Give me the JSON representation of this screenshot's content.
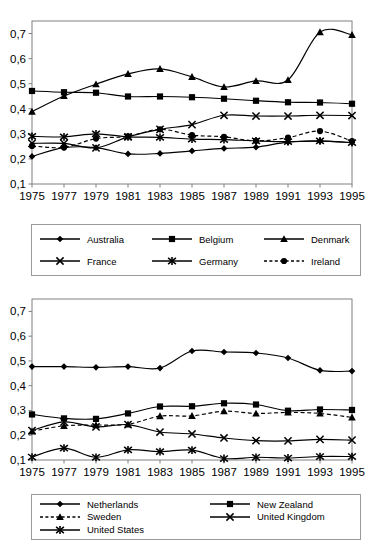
{
  "chart_data": [
    {
      "type": "line",
      "title": "",
      "xlabel": "",
      "ylabel": "",
      "x": [
        1975,
        1977,
        1979,
        1981,
        1983,
        1985,
        1987,
        1989,
        1991,
        1993,
        1995
      ],
      "xtick_labels": [
        "1975",
        "1977",
        "1979",
        "1981",
        "1983",
        "1985",
        "1987",
        "1989",
        "1991",
        "1993",
        "1995"
      ],
      "ytick_labels": [
        "0,1",
        "0,2",
        "0,3",
        "0,4",
        "0,5",
        "0,6",
        "0,7"
      ],
      "yticks": [
        0.1,
        0.2,
        0.3,
        0.4,
        0.5,
        0.6,
        0.7
      ],
      "ylim": [
        0.1,
        0.75
      ],
      "grid": false,
      "legend_position": "below",
      "series": [
        {
          "name": "Australia",
          "marker": "diamond",
          "dash": "solid",
          "values": [
            0.21,
            0.245,
            0.245,
            0.22,
            0.222,
            0.232,
            0.242,
            0.247,
            0.267,
            0.271,
            0.265
          ]
        },
        {
          "name": "Belgium",
          "marker": "square",
          "dash": "solid",
          "values": [
            0.471,
            0.466,
            0.464,
            0.449,
            0.449,
            0.446,
            0.44,
            0.432,
            0.426,
            0.425,
            0.42
          ]
        },
        {
          "name": "Denmark",
          "marker": "triangle",
          "dash": "solid",
          "values": [
            0.389,
            0.451,
            0.498,
            0.539,
            0.559,
            0.527,
            0.487,
            0.511,
            0.515,
            0.706,
            0.695
          ]
        },
        {
          "name": "France",
          "marker": "x",
          "dash": "solid",
          "values": [
            0.262,
            0.262,
            0.244,
            0.288,
            0.318,
            0.337,
            0.374,
            0.371,
            0.371,
            0.374,
            0.373
          ]
        },
        {
          "name": "Germany",
          "marker": "star",
          "dash": "solid",
          "values": [
            0.29,
            0.288,
            0.3,
            0.288,
            0.286,
            0.279,
            0.277,
            0.272,
            0.269,
            0.272,
            0.265
          ]
        },
        {
          "name": "Ireland",
          "marker": "circle",
          "dash": "dashed",
          "values": [
            0.252,
            0.246,
            0.281,
            0.29,
            0.318,
            0.295,
            0.288,
            0.272,
            0.285,
            0.311,
            0.271
          ]
        }
      ]
    },
    {
      "type": "line",
      "title": "",
      "xlabel": "",
      "ylabel": "",
      "x": [
        1975,
        1977,
        1979,
        1981,
        1983,
        1985,
        1987,
        1989,
        1991,
        1993,
        1995
      ],
      "xtick_labels": [
        "1975",
        "1977",
        "1979",
        "1981",
        "1983",
        "1985",
        "1987",
        "1989",
        "1991",
        "1993",
        "1995"
      ],
      "ytick_labels": [
        "0,1",
        "0,2",
        "0,3",
        "0,4",
        "0,5",
        "0,6",
        "0,7"
      ],
      "yticks": [
        0.1,
        0.2,
        0.3,
        0.4,
        0.5,
        0.6,
        0.7
      ],
      "ylim": [
        0.1,
        0.75
      ],
      "grid": false,
      "legend_position": "below",
      "series": [
        {
          "name": "Netherlands",
          "marker": "diamond",
          "dash": "solid",
          "values": [
            0.477,
            0.477,
            0.474,
            0.477,
            0.471,
            0.54,
            0.536,
            0.532,
            0.512,
            0.462,
            0.459
          ]
        },
        {
          "name": "New Zealand",
          "marker": "square",
          "dash": "solid",
          "values": [
            0.284,
            0.268,
            0.266,
            0.288,
            0.316,
            0.317,
            0.329,
            0.324,
            0.299,
            0.304,
            0.302
          ]
        },
        {
          "name": "Sweden",
          "marker": "triangle",
          "dash": "dashed",
          "values": [
            0.216,
            0.238,
            0.241,
            0.244,
            0.277,
            0.278,
            0.297,
            0.288,
            0.292,
            0.288,
            0.272
          ]
        },
        {
          "name": "United Kingdom",
          "marker": "x",
          "dash": "solid",
          "values": [
            0.219,
            0.254,
            0.234,
            0.243,
            0.213,
            0.205,
            0.189,
            0.178,
            0.177,
            0.183,
            0.18
          ]
        },
        {
          "name": "United States",
          "marker": "star",
          "dash": "solid",
          "values": [
            0.112,
            0.148,
            0.111,
            0.141,
            0.134,
            0.14,
            0.106,
            0.111,
            0.108,
            0.114,
            0.114
          ]
        }
      ]
    }
  ],
  "chart1": {
    "legend": [
      {
        "label": "Australia",
        "marker": "diamond",
        "dash": "solid"
      },
      {
        "label": "Belgium",
        "marker": "square",
        "dash": "solid"
      },
      {
        "label": "Denmark",
        "marker": "triangle",
        "dash": "solid"
      },
      {
        "label": "France",
        "marker": "x",
        "dash": "solid"
      },
      {
        "label": "Germany",
        "marker": "star",
        "dash": "solid"
      },
      {
        "label": "Ireland",
        "marker": "circle",
        "dash": "dashed"
      }
    ]
  },
  "chart2": {
    "legend": [
      {
        "label": "Netherlands",
        "marker": "diamond",
        "dash": "solid"
      },
      {
        "label": "New Zealand",
        "marker": "square",
        "dash": "solid"
      },
      {
        "label": "Sweden",
        "marker": "triangle",
        "dash": "dashed"
      },
      {
        "label": "United Kingdom",
        "marker": "x",
        "dash": "solid"
      },
      {
        "label": "United States",
        "marker": "star",
        "dash": "solid"
      }
    ]
  },
  "style": {
    "line_color": "#000000",
    "axis_color": "#808080",
    "text_color": "#000000",
    "background": "#ffffff"
  }
}
